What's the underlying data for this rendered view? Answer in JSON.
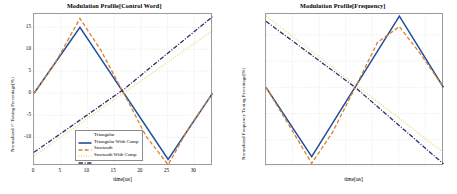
{
  "figure": {
    "panels": [
      {
        "id": "control-word",
        "title": "Modulation Profile[Control Word]",
        "xlabel": "time[us]",
        "ylabel": "Normalized /^ Tuning Percentage[%]",
        "legend_position": "center-bottom",
        "legend": [
          {
            "label": "Triangular",
            "color": "#1f4e9c",
            "style": "solid"
          },
          {
            "label": "Triangular With Comp",
            "color": "#d9822b",
            "style": "dashed"
          },
          {
            "label": "Sawtooth",
            "color": "#edd36a",
            "style": "dotted"
          },
          {
            "label": "Sawtooth With Comp",
            "color": "#2b2f6b",
            "style": "dashdot"
          }
        ]
      },
      {
        "id": "frequency",
        "title": "Modulation Profile[Frequency]",
        "xlabel": "time[us]",
        "ylabel": "Normalized Frequency Tuning Percentage[%]",
        "legend_position": "right-bottom",
        "legend": [
          {
            "label": "Triangular",
            "color": "#1f4e9c",
            "style": "solid"
          },
          {
            "label": "Triangular With Comp",
            "color": "#d9822b",
            "style": "dashed"
          },
          {
            "label": "Sawtooth",
            "color": "#edd36a",
            "style": "dotted"
          },
          {
            "label": "Sawtooth With Comp",
            "color": "#2b2f6b",
            "style": "dashdot"
          }
        ]
      }
    ]
  },
  "chart_data": [
    {
      "type": "line",
      "title": "Modulation Profile[Control Word]",
      "xlabel": "time[us]",
      "ylabel": "Normalized /^ Tuning Percentage[%]",
      "xlim": [
        0,
        33.5
      ],
      "ylim": [
        -16.5,
        18
      ],
      "xticks": [
        0,
        5,
        10,
        15,
        20,
        25,
        30
      ],
      "yticks": [
        -10,
        -5,
        0,
        5,
        10,
        15
      ],
      "grid": true,
      "legend_position": "center-bottom",
      "series": [
        {
          "name": "Triangular",
          "color": "#1f4e9c",
          "style": "solid",
          "x": [
            0,
            8.6,
            25.1,
            33.4
          ],
          "y": [
            0,
            15,
            -15,
            0
          ]
        },
        {
          "name": "Triangular With Comp",
          "color": "#d9822b",
          "style": "dashed",
          "x": [
            0,
            4.2,
            8.6,
            12.5,
            16.8,
            21.0,
            25.1,
            29.2,
            33.4
          ],
          "y": [
            0,
            7.4,
            17.0,
            9.8,
            0,
            -9.8,
            -16.2,
            -7.4,
            0
          ]
        },
        {
          "name": "Sawtooth",
          "color": "#edd36a",
          "style": "dotted",
          "x": [
            0,
            33.4
          ],
          "y": [
            -14.2,
            14.2
          ]
        },
        {
          "name": "Sawtooth With Comp",
          "color": "#2b2f6b",
          "style": "dashdot",
          "x": [
            0,
            16.8,
            33.4
          ],
          "y": [
            -13.4,
            0.9,
            17.4
          ]
        }
      ]
    },
    {
      "type": "line",
      "title": "Modulation Profile[Frequency]",
      "xlabel": "time[us]",
      "ylabel": "Normalized Frequency Tuning Percentage[%]",
      "xlim": [
        0,
        33.5
      ],
      "ylim": [
        -15,
        14
      ],
      "xticks": [
        0,
        5,
        10,
        15,
        20,
        25,
        30
      ],
      "yticks": [
        -15,
        -10,
        -5,
        0,
        5,
        10
      ],
      "grid": true,
      "legend_position": "right-bottom",
      "series": [
        {
          "name": "Triangular",
          "color": "#1f4e9c",
          "style": "solid",
          "x": [
            0,
            8.6,
            25.1,
            33.4
          ],
          "y": [
            0,
            -13.2,
            13.6,
            0
          ]
        },
        {
          "name": "Triangular With Comp",
          "color": "#d9822b",
          "style": "dashed",
          "x": [
            0,
            4.2,
            8.6,
            12.5,
            16.8,
            21.0,
            25.1,
            29.2,
            33.4
          ],
          "y": [
            0,
            -7.0,
            -14.5,
            -8.6,
            0,
            8.6,
            11.6,
            6.2,
            0
          ]
        },
        {
          "name": "Sawtooth",
          "color": "#edd36a",
          "style": "dotted",
          "x": [
            0,
            33.4
          ],
          "y": [
            13.6,
            -12.4
          ]
        },
        {
          "name": "Sawtooth With Comp",
          "color": "#2b2f6b",
          "style": "dashdot",
          "x": [
            0,
            16.8,
            33.4
          ],
          "y": [
            12.6,
            0,
            -14.6
          ]
        }
      ]
    }
  ]
}
